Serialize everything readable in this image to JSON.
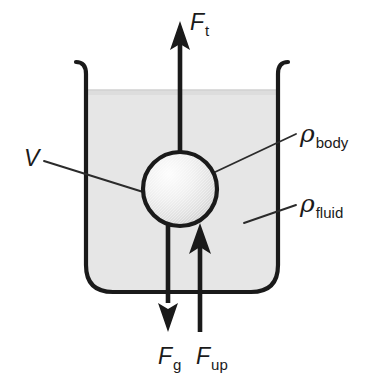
{
  "figure": {
    "type": "physics-free-body-diagram"
  },
  "colors": {
    "stroke": "#1a1a1a",
    "fluid_fill": "#e6e6e6",
    "fluid_top_edge": "#dcdcdc",
    "sphere_light": "#fdfdfd",
    "sphere_mid": "#ededed",
    "sphere_dark": "#d2d2d2",
    "leader_line": "#2b2b2b",
    "background": "#ffffff"
  },
  "container": {
    "name": "beaker",
    "fluid_label_visible": true
  },
  "forces": [
    {
      "id": "tension",
      "symbol": "F",
      "subscript": "t",
      "direction": "up",
      "label_x": 190,
      "label_y": 30
    },
    {
      "id": "gravity",
      "symbol": "F",
      "subscript": "g",
      "direction": "down",
      "label_x": 158,
      "label_y": 364
    },
    {
      "id": "buoyancy",
      "symbol": "F",
      "subscript": "up",
      "direction": "up",
      "label_x": 196,
      "label_y": 364
    }
  ],
  "quantities": [
    {
      "id": "volume",
      "symbol": "V",
      "subscript": "",
      "label_x": 24,
      "label_y": 166,
      "has_leader": true
    },
    {
      "id": "density-body",
      "symbol": "ρ",
      "subscript": "body",
      "label_x": 300,
      "label_y": 142,
      "has_leader": true
    },
    {
      "id": "density-fluid",
      "symbol": "ρ",
      "subscript": "fluid",
      "label_x": 300,
      "label_y": 212,
      "has_leader": true
    }
  ],
  "body": {
    "shape": "sphere",
    "center_x": 180,
    "center_y": 189,
    "radius": 37
  }
}
